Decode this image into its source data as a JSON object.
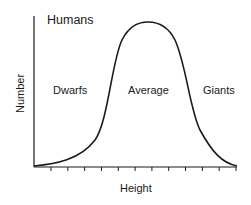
{
  "chart_data": {
    "type": "line",
    "title": "Humans",
    "xlabel": "Height",
    "ylabel": "Number",
    "annotations": [
      "Dwarfs",
      "Average",
      "Giants"
    ],
    "x_ticks_count": 12,
    "x_tick_labels": [],
    "y_tick_labels": [],
    "grid": false,
    "legend": null,
    "x": [
      0,
      1,
      2,
      3,
      4,
      5,
      6,
      7,
      8,
      9,
      10,
      11,
      12
    ],
    "values": [
      0,
      3,
      8,
      18,
      40,
      80,
      97,
      100,
      92,
      55,
      22,
      6,
      0
    ],
    "colors": {
      "curve": "#1a1a1a",
      "axis": "#1a1a1a",
      "background": "#ffffff"
    }
  },
  "labels": {
    "title": "Humans",
    "ylabel": "Number",
    "xlabel": "Height",
    "left_region": "Dwarfs",
    "center_region": "Average",
    "right_region": "Giants"
  }
}
